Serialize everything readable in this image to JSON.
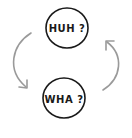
{
  "diagram": {
    "type": "cycle",
    "nodes": [
      {
        "id": "top",
        "label": "HUH ?"
      },
      {
        "id": "bottom",
        "label": "WHA ?"
      }
    ],
    "edges": [
      {
        "from": "top",
        "to": "bottom",
        "side": "left"
      },
      {
        "from": "bottom",
        "to": "top",
        "side": "right"
      }
    ],
    "colors": {
      "circle_stroke": "#1a1a1a",
      "arrow_stroke": "#9a9a9a",
      "background": "#ffffff"
    }
  }
}
